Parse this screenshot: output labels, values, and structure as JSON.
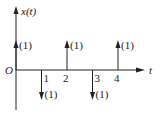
{
  "diagram": {
    "y_axis_label": "x(t)",
    "x_axis_label": "t",
    "origin_label": "O",
    "tick_labels": [
      "1",
      "2",
      "3",
      "4"
    ],
    "impulses": [
      {
        "t": 0,
        "weight": 1,
        "label": "(1)"
      },
      {
        "t": 1,
        "weight": -1,
        "label": "(1)"
      },
      {
        "t": 2,
        "weight": 1,
        "label": "(1)"
      },
      {
        "t": 3,
        "weight": -1,
        "label": "(1)"
      },
      {
        "t": 4,
        "weight": 1,
        "label": "(1)"
      }
    ],
    "colors": {
      "stroke": "#222222",
      "background": "#ffffff"
    }
  }
}
